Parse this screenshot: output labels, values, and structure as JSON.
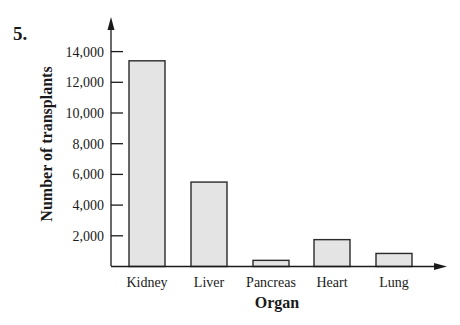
{
  "problem_number": "5.",
  "chart_data": {
    "type": "bar",
    "title": "",
    "xlabel": "Organ",
    "ylabel": "Number of transplants",
    "categories": [
      "Kidney",
      "Liver",
      "Pancreas",
      "Heart",
      "Lung"
    ],
    "values": [
      13400,
      5500,
      400,
      1750,
      850
    ],
    "yticks": [
      2000,
      4000,
      6000,
      8000,
      10000,
      12000,
      14000
    ],
    "ytick_labels": [
      "2,000",
      "4,000",
      "6,000",
      "8,000",
      "10,000",
      "12,000",
      "14,000"
    ],
    "ylim": [
      0,
      15500
    ],
    "grid": false,
    "legend": null,
    "bar_fill": "#e4e4e4",
    "bar_stroke": "#2a2a2a",
    "axis_color": "#1a1a1a"
  }
}
